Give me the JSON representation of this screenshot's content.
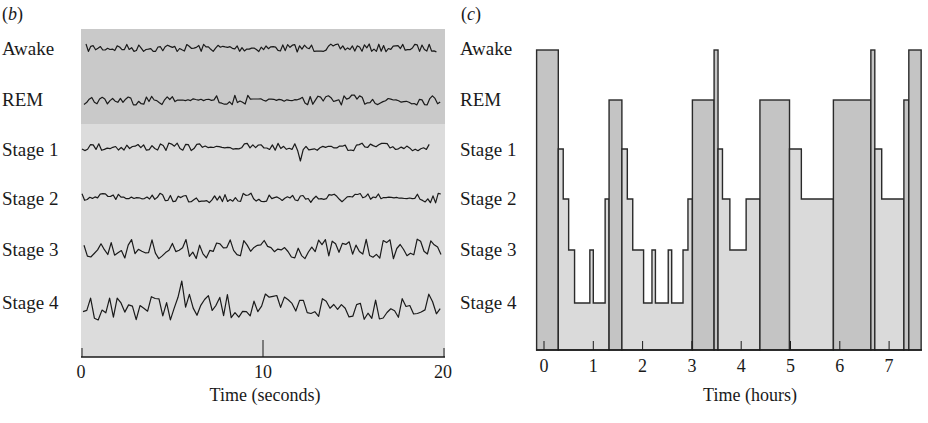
{
  "chart_data": [
    {
      "panel": "(b)",
      "type": "line",
      "title": "",
      "xlabel": "Time (seconds)",
      "ylabel": "",
      "xlim": [
        0,
        20
      ],
      "xticks": [
        0,
        10,
        20
      ],
      "grid": false,
      "series": [
        {
          "name": "Awake",
          "description": "low-amplitude, high-frequency EEG"
        },
        {
          "name": "REM",
          "description": "low-amplitude, high-frequency EEG similar to awake"
        },
        {
          "name": "Stage 1",
          "description": "low-amplitude, mixed-frequency EEG"
        },
        {
          "name": "Stage 2",
          "description": "EEG with spindles and K-complexes"
        },
        {
          "name": "Stage 3",
          "description": "higher-amplitude, slower EEG"
        },
        {
          "name": "Stage 4",
          "description": "high-amplitude, slow-wave EEG"
        }
      ],
      "background_bands": [
        {
          "rows": [
            "Awake",
            "REM"
          ],
          "color": "#c9c9c9"
        },
        {
          "rows": [
            "Stage 1",
            "Stage 2",
            "Stage 3",
            "Stage 4"
          ],
          "color": "#dcdcdc"
        }
      ]
    },
    {
      "panel": "(c)",
      "type": "area",
      "title": "",
      "xlabel": "Time (hours)",
      "ylabel": "",
      "xlim": [
        -0.15,
        7.65
      ],
      "xticks": [
        0,
        1,
        2,
        3,
        4,
        5,
        6,
        7
      ],
      "ycategories": [
        "Awake",
        "REM",
        "Stage 1",
        "Stage 2",
        "Stage 3",
        "Stage 4"
      ],
      "grid": false,
      "hypnogram": [
        {
          "start": -0.15,
          "end": 0.29,
          "stage": "Awake"
        },
        {
          "start": 0.29,
          "end": 0.39,
          "stage": "Stage 1"
        },
        {
          "start": 0.39,
          "end": 0.5,
          "stage": "Stage 2"
        },
        {
          "start": 0.5,
          "end": 0.62,
          "stage": "Stage 3"
        },
        {
          "start": 0.62,
          "end": 0.93,
          "stage": "Stage 4"
        },
        {
          "start": 0.93,
          "end": 1.0,
          "stage": "Stage 3"
        },
        {
          "start": 1.0,
          "end": 1.24,
          "stage": "Stage 4"
        },
        {
          "start": 1.24,
          "end": 1.32,
          "stage": "Stage 2"
        },
        {
          "start": 1.32,
          "end": 1.58,
          "stage": "REM"
        },
        {
          "start": 1.58,
          "end": 1.69,
          "stage": "Stage 1"
        },
        {
          "start": 1.69,
          "end": 1.8,
          "stage": "Stage 2"
        },
        {
          "start": 1.8,
          "end": 2.02,
          "stage": "Stage 3"
        },
        {
          "start": 2.02,
          "end": 2.19,
          "stage": "Stage 4"
        },
        {
          "start": 2.19,
          "end": 2.26,
          "stage": "Stage 3"
        },
        {
          "start": 2.26,
          "end": 2.52,
          "stage": "Stage 4"
        },
        {
          "start": 2.52,
          "end": 2.59,
          "stage": "Stage 3"
        },
        {
          "start": 2.59,
          "end": 2.82,
          "stage": "Stage 4"
        },
        {
          "start": 2.82,
          "end": 2.92,
          "stage": "Stage 3"
        },
        {
          "start": 2.92,
          "end": 3.01,
          "stage": "Stage 2"
        },
        {
          "start": 3.01,
          "end": 3.45,
          "stage": "REM"
        },
        {
          "start": 3.45,
          "end": 3.53,
          "stage": "Awake"
        },
        {
          "start": 3.53,
          "end": 3.62,
          "stage": "Stage 1"
        },
        {
          "start": 3.62,
          "end": 3.77,
          "stage": "Stage 2"
        },
        {
          "start": 3.77,
          "end": 4.1,
          "stage": "Stage 3"
        },
        {
          "start": 4.1,
          "end": 4.38,
          "stage": "Stage 2"
        },
        {
          "start": 4.38,
          "end": 4.98,
          "stage": "REM"
        },
        {
          "start": 4.98,
          "end": 5.22,
          "stage": "Stage 1"
        },
        {
          "start": 5.22,
          "end": 5.87,
          "stage": "Stage 2"
        },
        {
          "start": 5.87,
          "end": 6.63,
          "stage": "REM"
        },
        {
          "start": 6.63,
          "end": 6.71,
          "stage": "Awake"
        },
        {
          "start": 6.71,
          "end": 6.85,
          "stage": "Stage 1"
        },
        {
          "start": 6.85,
          "end": 7.3,
          "stage": "Stage 2"
        },
        {
          "start": 7.3,
          "end": 7.4,
          "stage": "REM"
        },
        {
          "start": 7.4,
          "end": 7.65,
          "stage": "Awake"
        }
      ],
      "colors": {
        "awake_rem_fill": "#c4c4c4",
        "nrem_fill": "#dadada",
        "outline": "#2a2a2a"
      }
    }
  ],
  "panel_b": {
    "label_open": "(",
    "label_letter": "b",
    "label_close": ")",
    "rows": [
      "Awake",
      "REM",
      "Stage 1",
      "Stage 2",
      "Stage 3",
      "Stage 4"
    ],
    "xticks": [
      "0",
      "10",
      "20"
    ],
    "xlabel": "Time (seconds)"
  },
  "panel_c": {
    "label_open": "(",
    "label_letter": "c",
    "label_close": ")",
    "rows": [
      "Awake",
      "REM",
      "Stage 1",
      "Stage 2",
      "Stage 3",
      "Stage 4"
    ],
    "xticks": [
      "0",
      "1",
      "2",
      "3",
      "4",
      "5",
      "6",
      "7"
    ],
    "xlabel": "Time (hours)"
  }
}
